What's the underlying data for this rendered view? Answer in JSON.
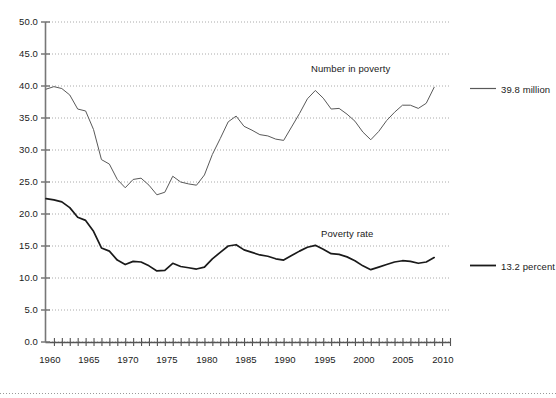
{
  "chart_data": {
    "type": "line",
    "title": "",
    "subtitle": "",
    "xlabel": "",
    "ylabel": "",
    "xlim": [
      1959,
      2010
    ],
    "ylim": [
      0.0,
      50.0
    ],
    "grid": true,
    "legend_position": "right",
    "y_ticks": [
      "0.0",
      "5.0",
      "10.0",
      "15.0",
      "20.0",
      "25.0",
      "30.0",
      "35.0",
      "40.0",
      "45.0",
      "50.0"
    ],
    "y_tick_values": [
      0,
      5,
      10,
      15,
      20,
      25,
      30,
      35,
      40,
      45,
      50
    ],
    "x_ticks": [
      "1960",
      "1965",
      "1970",
      "1975",
      "1980",
      "1985",
      "1990",
      "1995",
      "2000",
      "2005",
      "2010"
    ],
    "x_tick_values": [
      1960,
      1965,
      1970,
      1975,
      1980,
      1985,
      1990,
      1995,
      2000,
      2005,
      2010
    ],
    "x_minor_tick_interval": 1,
    "annotations": [
      {
        "text": "Number in poverty",
        "x": 1994,
        "y": 44.0
      },
      {
        "text": "Poverty rate",
        "x": 1994,
        "y": 18.6
      }
    ],
    "series": [
      {
        "name": "Number in poverty",
        "legend_label": "39.8 million",
        "unit": "million",
        "color": "#595959",
        "linewidth": 1.0,
        "x": [
          1959,
          1960,
          1961,
          1962,
          1963,
          1964,
          1965,
          1966,
          1967,
          1968,
          1969,
          1970,
          1971,
          1972,
          1973,
          1974,
          1975,
          1976,
          1977,
          1978,
          1979,
          1980,
          1981,
          1982,
          1983,
          1984,
          1985,
          1986,
          1987,
          1988,
          1989,
          1990,
          1991,
          1992,
          1993,
          1994,
          1995,
          1996,
          1997,
          1998,
          1999,
          2000,
          2001,
          2002,
          2003,
          2004,
          2005,
          2006,
          2007,
          2008
        ],
        "values": [
          39.5,
          39.9,
          39.6,
          38.6,
          36.4,
          36.1,
          33.2,
          28.5,
          27.8,
          25.4,
          24.1,
          25.4,
          25.6,
          24.5,
          23.0,
          23.4,
          25.9,
          25.0,
          24.7,
          24.5,
          26.1,
          29.3,
          31.8,
          34.4,
          35.3,
          33.7,
          33.1,
          32.4,
          32.2,
          31.7,
          31.5,
          33.6,
          35.7,
          38.0,
          39.3,
          38.1,
          36.4,
          36.5,
          35.6,
          34.5,
          32.8,
          31.6,
          32.9,
          34.6,
          35.9,
          37.0,
          37.0,
          36.5,
          37.3,
          39.8
        ]
      },
      {
        "name": "Poverty rate",
        "legend_label": "13.2 percent",
        "unit": "percent",
        "color": "#1a1a1a",
        "linewidth": 1.7,
        "x": [
          1959,
          1960,
          1961,
          1962,
          1963,
          1964,
          1965,
          1966,
          1967,
          1968,
          1969,
          1970,
          1971,
          1972,
          1973,
          1974,
          1975,
          1976,
          1977,
          1978,
          1979,
          1980,
          1981,
          1982,
          1983,
          1984,
          1985,
          1986,
          1987,
          1988,
          1989,
          1990,
          1991,
          1992,
          1993,
          1994,
          1995,
          1996,
          1997,
          1998,
          1999,
          2000,
          2001,
          2002,
          2003,
          2004,
          2005,
          2006,
          2007,
          2008
        ],
        "values": [
          22.4,
          22.2,
          21.9,
          21.0,
          19.5,
          19.0,
          17.3,
          14.7,
          14.2,
          12.8,
          12.1,
          12.6,
          12.5,
          11.9,
          11.1,
          11.2,
          12.3,
          11.8,
          11.6,
          11.4,
          11.7,
          13.0,
          14.0,
          15.0,
          15.2,
          14.4,
          14.0,
          13.6,
          13.4,
          13.0,
          12.8,
          13.5,
          14.2,
          14.8,
          15.1,
          14.5,
          13.8,
          13.7,
          13.3,
          12.7,
          11.9,
          11.3,
          11.7,
          12.1,
          12.5,
          12.7,
          12.6,
          12.3,
          12.5,
          13.2
        ]
      }
    ]
  },
  "legend": {
    "items": [
      {
        "label": "39.8 million",
        "color": "#595959"
      },
      {
        "label": "13.2 percent",
        "color": "#1a1a1a"
      }
    ]
  }
}
